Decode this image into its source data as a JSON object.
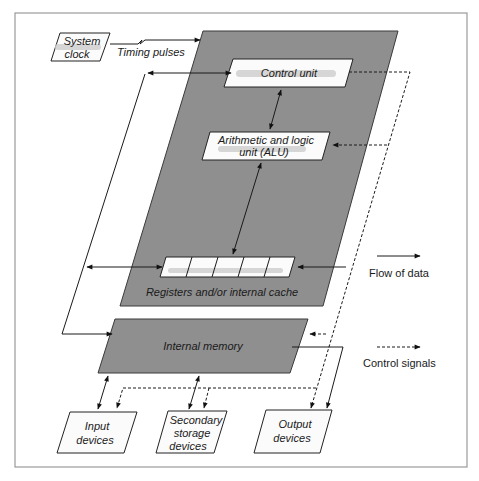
{
  "diagram": {
    "nodes": {
      "system_clock": {
        "line1": "System",
        "line2": "clock"
      },
      "timing_pulses": "Timing pulses",
      "control_unit": "Control unit",
      "alu": {
        "line1": "Arithmetic and logic",
        "line2": "unit (ALU)"
      },
      "registers": "Registers and/or internal cache",
      "internal_memory": "Internal memory",
      "input_devices": {
        "line1": "Input",
        "line2": "devices"
      },
      "secondary_storage": {
        "line1": "Secondary",
        "line2": "storage",
        "line3": "devices"
      },
      "output_devices": {
        "line1": "Output",
        "line2": "devices"
      }
    },
    "legend": {
      "flow_of_data": "Flow of data",
      "control_signals": "Control signals"
    },
    "colors": {
      "cpu_fill": "#8f8f8f",
      "memory_fill": "#8f8f8f",
      "box_fill": "#fbfbfb",
      "frame_stroke": "#9a9a9a"
    },
    "register_cells": 5
  }
}
